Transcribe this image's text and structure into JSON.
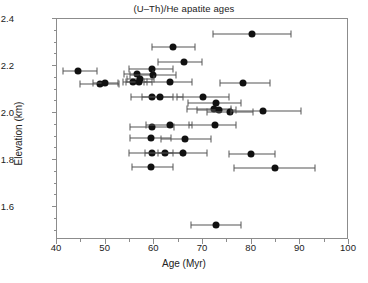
{
  "chart_data": {
    "type": "scatter",
    "title": "(U–Th)/He apatite ages",
    "xlabel": "Age (Myr)",
    "ylabel": "Elevation (km)",
    "xlim": [
      40,
      100
    ],
    "ylim": [
      1.46,
      2.4
    ],
    "xticks": [
      40,
      50,
      60,
      70,
      80,
      90,
      100
    ],
    "xtick_labels": [
      "40",
      "50",
      "60",
      "70",
      "80",
      "90",
      "100"
    ],
    "xminor_step": 5,
    "yticks": [
      1.6,
      1.8,
      2.0,
      2.2,
      2.4
    ],
    "ytick_labels": [
      "1.6",
      "1.8",
      "2.0",
      "2.2",
      "2.4"
    ],
    "grid": false,
    "legend": null,
    "marker": "filled-circle",
    "errorbars": "horizontal-x",
    "point_color": "#111111",
    "errorbar_color": "#555555",
    "axis_color": "#8c8c8c",
    "points": [
      {
        "x": 80.3,
        "y": 2.333,
        "xerr_low": 72.3,
        "xerr_high": 88.2
      },
      {
        "x": 64.0,
        "y": 2.277,
        "xerr_low": 59.8,
        "xerr_high": 68.6
      },
      {
        "x": 66.4,
        "y": 2.212,
        "xerr_low": 61.0,
        "xerr_high": 70.0
      },
      {
        "x": 44.5,
        "y": 2.175,
        "xerr_low": 41.5,
        "xerr_high": 48.4
      },
      {
        "x": 59.7,
        "y": 2.184,
        "xerr_low": 55.0,
        "xerr_high": 64.0
      },
      {
        "x": 56.6,
        "y": 2.161,
        "xerr_low": 54.0,
        "xerr_high": 60.0
      },
      {
        "x": 59.9,
        "y": 2.157,
        "xerr_low": 55.2,
        "xerr_high": 64.6
      },
      {
        "x": 57.2,
        "y": 2.14,
        "xerr_low": 54.6,
        "xerr_high": 60.2
      },
      {
        "x": 55.9,
        "y": 2.127,
        "xerr_low": 53.8,
        "xerr_high": 58.6
      },
      {
        "x": 57.0,
        "y": 2.127,
        "xerr_low": 54.4,
        "xerr_high": 59.8
      },
      {
        "x": 49.0,
        "y": 2.12,
        "xerr_low": 45.0,
        "xerr_high": 53.0
      },
      {
        "x": 50.0,
        "y": 2.122,
        "xerr_low": 47.6,
        "xerr_high": 52.8
      },
      {
        "x": 63.4,
        "y": 2.126,
        "xerr_low": 58.0,
        "xerr_high": 68.0
      },
      {
        "x": 78.4,
        "y": 2.124,
        "xerr_low": 73.6,
        "xerr_high": 84.0
      },
      {
        "x": 59.7,
        "y": 2.066,
        "xerr_low": 55.4,
        "xerr_high": 64.0
      },
      {
        "x": 61.3,
        "y": 2.066,
        "xerr_low": 57.6,
        "xerr_high": 66.0
      },
      {
        "x": 70.2,
        "y": 2.064,
        "xerr_low": 64.8,
        "xerr_high": 75.6
      },
      {
        "x": 72.8,
        "y": 2.039,
        "xerr_low": 67.2,
        "xerr_high": 78.0
      },
      {
        "x": 72.4,
        "y": 2.012,
        "xerr_low": 67.0,
        "xerr_high": 76.0
      },
      {
        "x": 73.4,
        "y": 2.01,
        "xerr_low": 69.0,
        "xerr_high": 77.0
      },
      {
        "x": 75.8,
        "y": 2.0,
        "xerr_low": 71.0,
        "xerr_high": 80.4
      },
      {
        "x": 82.6,
        "y": 2.004,
        "xerr_low": 76.0,
        "xerr_high": 90.4
      },
      {
        "x": 59.7,
        "y": 1.938,
        "xerr_low": 55.2,
        "xerr_high": 64.2
      },
      {
        "x": 63.5,
        "y": 1.947,
        "xerr_low": 58.4,
        "xerr_high": 68.0
      },
      {
        "x": 72.6,
        "y": 1.945,
        "xerr_low": 67.4,
        "xerr_high": 77.0
      },
      {
        "x": 59.6,
        "y": 1.888,
        "xerr_low": 55.2,
        "xerr_high": 63.6
      },
      {
        "x": 66.6,
        "y": 1.886,
        "xerr_low": 61.6,
        "xerr_high": 71.8
      },
      {
        "x": 59.8,
        "y": 1.824,
        "xerr_low": 55.0,
        "xerr_high": 64.0
      },
      {
        "x": 62.4,
        "y": 1.824,
        "xerr_low": 58.2,
        "xerr_high": 66.0
      },
      {
        "x": 66.0,
        "y": 1.824,
        "xerr_low": 61.0,
        "xerr_high": 71.0
      },
      {
        "x": 80.0,
        "y": 1.822,
        "xerr_low": 75.6,
        "xerr_high": 85.0
      },
      {
        "x": 59.6,
        "y": 1.765,
        "xerr_low": 55.6,
        "xerr_high": 64.0
      },
      {
        "x": 84.9,
        "y": 1.762,
        "xerr_low": 76.6,
        "xerr_high": 93.2
      },
      {
        "x": 72.8,
        "y": 1.52,
        "xerr_low": 67.8,
        "xerr_high": 78.0
      }
    ]
  }
}
